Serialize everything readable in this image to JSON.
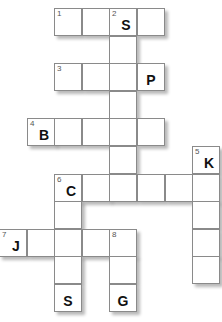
{
  "puzzle": {
    "type": "crossword",
    "unit_px": 27.6,
    "origin": {
      "x": -1,
      "y": 8
    },
    "cells": [
      {
        "r": 0,
        "c": 2,
        "num": "1",
        "letter": ""
      },
      {
        "r": 0,
        "c": 3,
        "num": "",
        "letter": ""
      },
      {
        "r": 0,
        "c": 4,
        "num": "2",
        "letter": "S"
      },
      {
        "r": 0,
        "c": 5,
        "num": "",
        "letter": ""
      },
      {
        "r": 1,
        "c": 4,
        "num": "",
        "letter": ""
      },
      {
        "r": 2,
        "c": 2,
        "num": "3",
        "letter": ""
      },
      {
        "r": 2,
        "c": 3,
        "num": "",
        "letter": ""
      },
      {
        "r": 2,
        "c": 4,
        "num": "",
        "letter": ""
      },
      {
        "r": 2,
        "c": 5,
        "num": "",
        "letter": "P"
      },
      {
        "r": 3,
        "c": 4,
        "num": "",
        "letter": ""
      },
      {
        "r": 4,
        "c": 1,
        "num": "4",
        "letter": "B"
      },
      {
        "r": 4,
        "c": 2,
        "num": "",
        "letter": ""
      },
      {
        "r": 4,
        "c": 3,
        "num": "",
        "letter": ""
      },
      {
        "r": 4,
        "c": 4,
        "num": "",
        "letter": ""
      },
      {
        "r": 4,
        "c": 5,
        "num": "",
        "letter": ""
      },
      {
        "r": 5,
        "c": 4,
        "num": "",
        "letter": ""
      },
      {
        "r": 5,
        "c": 7,
        "num": "5",
        "letter": "K"
      },
      {
        "r": 6,
        "c": 2,
        "num": "6",
        "letter": "C"
      },
      {
        "r": 6,
        "c": 3,
        "num": "",
        "letter": ""
      },
      {
        "r": 6,
        "c": 4,
        "num": "",
        "letter": ""
      },
      {
        "r": 6,
        "c": 5,
        "num": "",
        "letter": ""
      },
      {
        "r": 6,
        "c": 6,
        "num": "",
        "letter": ""
      },
      {
        "r": 6,
        "c": 7,
        "num": "",
        "letter": ""
      },
      {
        "r": 7,
        "c": 2,
        "num": "",
        "letter": ""
      },
      {
        "r": 7,
        "c": 7,
        "num": "",
        "letter": ""
      },
      {
        "r": 8,
        "c": 0,
        "num": "7",
        "letter": "J"
      },
      {
        "r": 8,
        "c": 1,
        "num": "",
        "letter": ""
      },
      {
        "r": 8,
        "c": 2,
        "num": "",
        "letter": ""
      },
      {
        "r": 8,
        "c": 3,
        "num": "",
        "letter": ""
      },
      {
        "r": 8,
        "c": 4,
        "num": "8",
        "letter": ""
      },
      {
        "r": 8,
        "c": 7,
        "num": "",
        "letter": ""
      },
      {
        "r": 9,
        "c": 2,
        "num": "",
        "letter": ""
      },
      {
        "r": 9,
        "c": 4,
        "num": "",
        "letter": ""
      },
      {
        "r": 9,
        "c": 7,
        "num": "",
        "letter": ""
      },
      {
        "r": 10,
        "c": 2,
        "num": "",
        "letter": "S"
      },
      {
        "r": 10,
        "c": 4,
        "num": "",
        "letter": "G"
      }
    ],
    "clues": {
      "across": [
        "1",
        "3",
        "4",
        "6",
        "7"
      ],
      "down": [
        "2",
        "5",
        "6",
        "8"
      ]
    }
  }
}
